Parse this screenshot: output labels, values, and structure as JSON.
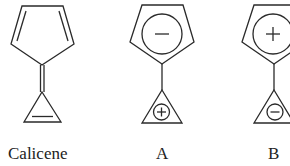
{
  "figure": {
    "structures": [
      {
        "id": "calicene",
        "label": "Calicene",
        "five_ring": "cyclopentadiene with two C=C double bonds",
        "bridge": "exocyclic double bond",
        "three_ring": "cyclopropene with one C=C double bond"
      },
      {
        "id": "A",
        "label": "A",
        "five_ring_charge": "−",
        "five_ring_charge_icon": "minus-in-circle",
        "bridge": "single bond",
        "three_ring_charge": "+",
        "three_ring_charge_icon": "plus-in-circle"
      },
      {
        "id": "B",
        "label": "B",
        "five_ring_charge": "+",
        "five_ring_charge_icon": "plus-in-circle",
        "bridge": "single bond",
        "three_ring_charge": "−",
        "three_ring_charge_icon": "minus-in-circle"
      }
    ]
  },
  "colors": {
    "line": "#2a2a2a",
    "background": "#ffffff",
    "text": "#222222"
  }
}
